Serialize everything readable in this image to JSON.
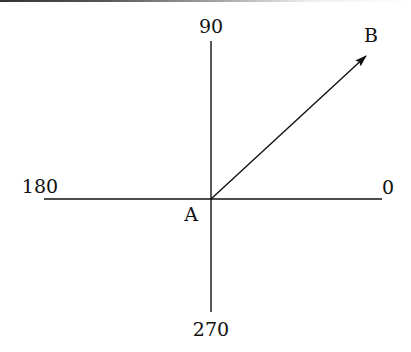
{
  "diagram": {
    "type": "bearing-axes",
    "origin": {
      "label": "A",
      "x": 211,
      "y": 199
    },
    "axes": {
      "horizontal": {
        "x1": 44,
        "x2": 382,
        "y": 199
      },
      "vertical": {
        "x": 211,
        "y1": 41,
        "y2": 312
      }
    },
    "direction_labels": {
      "east": "0",
      "north": "90",
      "west": "180",
      "south": "270"
    },
    "vector": {
      "from": "A",
      "to": "B",
      "label": "B",
      "tip": {
        "x": 366,
        "y": 56
      },
      "angle_deg": 45
    },
    "colors": {
      "line": "#111111",
      "background": "#ffffff"
    }
  }
}
